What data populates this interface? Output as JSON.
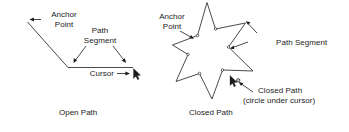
{
  "figure": {
    "background_color": "#ffffff",
    "ink_color": "#1b1b1b",
    "stroke_color": "#2a2a2a"
  },
  "open_path": {
    "caption": "Open Path",
    "labels": {
      "anchor_point_line1": "Anchor",
      "anchor_point_line2": "Point",
      "path_segment_line1": "Path",
      "path_segment_line2": "Segment",
      "cursor": "Cursor"
    },
    "icons": {
      "anchor_pointer": "left-arrow-icon",
      "segment_pointer_left": "diagonal-arrow-icon",
      "segment_pointer_right": "diagonal-arrow-icon",
      "cursor_pointer": "right-arrow-icon",
      "mouse_cursor": "mouse-cursor-icon"
    }
  },
  "closed_path": {
    "caption": "Closed Path",
    "labels": {
      "anchor_point_line1": "Anchor",
      "anchor_point_line2": "Point",
      "path_segment": "Path Segment",
      "closed_path_line1": "Closed Path",
      "closed_path_line2": "(circle under cursor)"
    },
    "icons": {
      "anchor_pointer": "diagonal-arrow-icon",
      "segment_pointer_top": "diagonal-arrow-icon",
      "segment_pointer_mid": "diagonal-arrow-icon",
      "closed_pointer": "diagonal-arrow-icon",
      "mouse_cursor": "mouse-cursor-icon",
      "circle_marker": "small-circle-icon"
    }
  }
}
